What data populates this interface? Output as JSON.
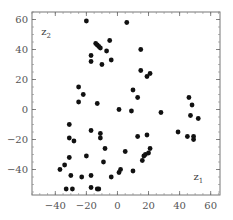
{
  "chart_data": {
    "type": "scatter",
    "title": "",
    "xlabel": "z1",
    "ylabel": "z2",
    "xlim": [
      -55,
      66
    ],
    "ylim": [
      -57,
      65
    ],
    "grid": false,
    "legend": null,
    "xticks": [
      -40,
      -20,
      0,
      20,
      40,
      60
    ],
    "yticks": [
      60,
      40,
      20,
      0,
      -20,
      -40
    ],
    "xtick_labels": [
      "−40",
      "−20",
      "0",
      "20",
      "40",
      "60"
    ],
    "ytick_labels": [
      "60",
      "40",
      "20",
      "0",
      "−20",
      "−40"
    ],
    "annotations": [
      {
        "text": "z",
        "sub": "2",
        "x": -49,
        "y": 50
      },
      {
        "text": "z",
        "sub": "1",
        "x": 49,
        "y": -47
      }
    ],
    "series": [
      {
        "name": "points",
        "color": "#111111",
        "points": [
          [
            -20,
            59
          ],
          [
            6,
            58
          ],
          [
            -14,
            44
          ],
          [
            -13,
            43
          ],
          [
            -12,
            42
          ],
          [
            -11,
            41
          ],
          [
            -5,
            46
          ],
          [
            -7,
            39
          ],
          [
            -17,
            36
          ],
          [
            -17,
            32
          ],
          [
            -10,
            30
          ],
          [
            -4,
            33
          ],
          [
            15,
            40
          ],
          [
            15,
            26
          ],
          [
            21,
            24
          ],
          [
            19,
            22
          ],
          [
            10,
            13
          ],
          [
            13,
            8
          ],
          [
            -25,
            15
          ],
          [
            -22,
            10
          ],
          [
            -25,
            5
          ],
          [
            -13,
            4
          ],
          [
            1,
            0
          ],
          [
            9,
            -1
          ],
          [
            28,
            -2
          ],
          [
            46,
            8
          ],
          [
            48,
            3
          ],
          [
            47,
            -4
          ],
          [
            52,
            -6
          ],
          [
            39,
            -15
          ],
          [
            45,
            -18
          ],
          [
            49,
            -18
          ],
          [
            49,
            -20
          ],
          [
            13,
            -18
          ],
          [
            19,
            -17
          ],
          [
            -31,
            -10
          ],
          [
            -17,
            -14
          ],
          [
            -11,
            -16
          ],
          [
            -11,
            -19
          ],
          [
            -31,
            -19
          ],
          [
            -28,
            -21
          ],
          [
            -8,
            -26
          ],
          [
            5,
            -28
          ],
          [
            -31,
            -32
          ],
          [
            -20,
            -31
          ],
          [
            -9,
            -35
          ],
          [
            21,
            -26
          ],
          [
            17,
            -31
          ],
          [
            18,
            -30
          ],
          [
            20,
            -29
          ],
          [
            16,
            -34
          ],
          [
            -37,
            -40
          ],
          [
            -34,
            -37
          ],
          [
            -30,
            -44
          ],
          [
            -23,
            -45
          ],
          [
            -17,
            -44
          ],
          [
            -4,
            -45
          ],
          [
            1,
            -42
          ],
          [
            2,
            -40
          ],
          [
            10,
            -41
          ],
          [
            -33,
            -53
          ],
          [
            -29,
            -53
          ],
          [
            -17,
            -52
          ],
          [
            -13,
            -53
          ],
          [
            -12,
            -53
          ]
        ]
      }
    ]
  }
}
